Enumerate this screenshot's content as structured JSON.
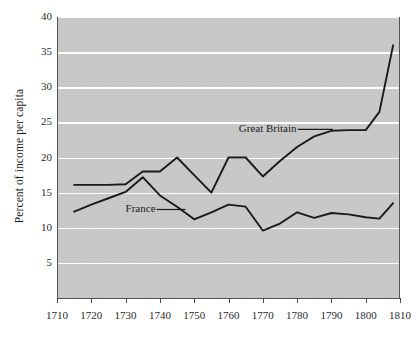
{
  "chart_data": {
    "type": "line",
    "title": "",
    "xlabel": "",
    "ylabel": "Percent of income per capita",
    "xlim": [
      1710,
      1810
    ],
    "ylim": [
      0,
      40
    ],
    "grid": true,
    "legend_position": "inline-annotation",
    "x_ticks": [
      1710,
      1720,
      1730,
      1740,
      1750,
      1760,
      1770,
      1780,
      1790,
      1800,
      1810
    ],
    "y_ticks": [
      5,
      10,
      15,
      20,
      25,
      30,
      35,
      40
    ],
    "series": [
      {
        "name": "Great Britain",
        "color": "#1a1a1a",
        "x": [
          1715,
          1720,
          1725,
          1730,
          1735,
          1740,
          1745,
          1750,
          1755,
          1760,
          1765,
          1770,
          1775,
          1780,
          1785,
          1790,
          1795,
          1800,
          1804,
          1808
        ],
        "values": [
          16.1,
          16.1,
          16.1,
          16.2,
          18.0,
          18.0,
          20.0,
          17.5,
          15.0,
          20.0,
          20.0,
          17.3,
          19.5,
          21.5,
          23.0,
          23.8,
          23.9,
          23.9,
          26.5,
          36.0
        ]
      },
      {
        "name": "France",
        "color": "#1a1a1a",
        "x": [
          1715,
          1720,
          1725,
          1730,
          1735,
          1740,
          1745,
          1750,
          1755,
          1760,
          1765,
          1770,
          1775,
          1780,
          1785,
          1790,
          1795,
          1800,
          1804,
          1808
        ],
        "values": [
          12.3,
          13.3,
          14.2,
          15.1,
          17.2,
          14.6,
          13.0,
          11.2,
          12.2,
          13.3,
          13.0,
          9.6,
          10.6,
          12.2,
          11.4,
          12.1,
          11.9,
          11.5,
          11.3,
          13.5
        ]
      }
    ],
    "annotations": [
      {
        "name": "great-britain-label",
        "text": "Great Britain",
        "x": 1763,
        "y": 24.0
      },
      {
        "name": "france-label",
        "text": "France",
        "x": 1730,
        "y": 12.6
      }
    ],
    "colors": {
      "plot_background": "#c9c9c9",
      "gridline": "#fdfdfd",
      "line": "#1a1a1a",
      "axis": "#555555",
      "page_background": "#ffffff"
    }
  }
}
